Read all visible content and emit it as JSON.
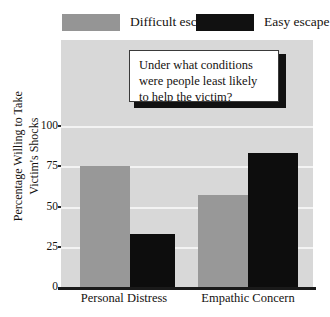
{
  "chart_data": {
    "type": "bar",
    "title": "",
    "subtitle": "",
    "xlabel": "",
    "ylabel": "Percentage Willing to Take Victim's Shocks",
    "ylabel_line1": "Percentage Willing to Take",
    "ylabel_line2": "Victim's Shocks",
    "categories": [
      "Personal Distress",
      "Empathic Concern"
    ],
    "series": [
      {
        "name": "Difficult escape",
        "color": "#989898",
        "values": [
          75,
          57
        ]
      },
      {
        "name": "Easy escape",
        "color": "#0d0d0d",
        "values": [
          33,
          83
        ]
      }
    ],
    "ylim": [
      0,
      100
    ],
    "yticks": [
      0,
      25,
      50,
      75,
      100
    ],
    "ytick_labels": [
      "0",
      "25",
      "50",
      "75",
      "100"
    ],
    "grid": true,
    "gridlines_at": [
      25,
      50,
      75,
      100
    ],
    "legend_position": "top",
    "plot_background": "#d8d8d8",
    "gridline_color": "#f3f3f3",
    "annotations": [
      {
        "name": "question-callout",
        "line1": "Under what conditions",
        "line2": "were people least likely",
        "line3": "to help the victim?"
      }
    ]
  },
  "legend": {
    "items": [
      {
        "label": "Difficult escape",
        "swatch": "grey-swatch"
      },
      {
        "label": "Easy escape",
        "swatch": "black-swatch"
      }
    ]
  },
  "axes": {
    "y": {
      "label_line1": "Percentage Willing to Take",
      "label_line2": "Victim's Shocks",
      "ticks": [
        "100",
        "75",
        "50",
        "25",
        "0"
      ]
    },
    "x": {
      "ticks": [
        "Personal Distress",
        "Empathic Concern"
      ]
    }
  },
  "callout": {
    "line1": "Under what conditions",
    "line2": "were people least likely",
    "line3": "to help the victim?"
  }
}
